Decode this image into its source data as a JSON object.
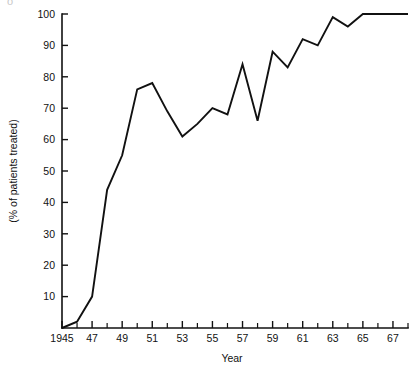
{
  "figure": {
    "corner_artifact": "o"
  },
  "chart_data": {
    "type": "line",
    "title": "",
    "subtitle": "",
    "xlabel": "Year",
    "ylabel": "(% of patients treated)",
    "xlim": [
      1945,
      1968
    ],
    "ylim": [
      0,
      100
    ],
    "grid": false,
    "legend": null,
    "legend_position": "none",
    "line_color": "#111111",
    "x_tick_step_minor": 1,
    "x_tick_step_major": 2,
    "y_tick_step": 10,
    "x_tick_labels": [
      "1945",
      "47",
      "49",
      "51",
      "53",
      "55",
      "57",
      "59",
      "61",
      "63",
      "65",
      "67"
    ],
    "x_tick_label_years": [
      1945,
      1947,
      1949,
      1951,
      1953,
      1955,
      1957,
      1959,
      1961,
      1963,
      1965,
      1967
    ],
    "y_tick_labels": [
      "10",
      "20",
      "30",
      "40",
      "50",
      "60",
      "70",
      "80",
      "90",
      "100"
    ],
    "y_tick_values": [
      10,
      20,
      30,
      40,
      50,
      60,
      70,
      80,
      90,
      100
    ],
    "x": [
      1945,
      1946,
      1947,
      1948,
      1949,
      1950,
      1951,
      1952,
      1953,
      1954,
      1955,
      1956,
      1957,
      1958,
      1959,
      1960,
      1961,
      1962,
      1963,
      1964,
      1965,
      1966,
      1967,
      1968
    ],
    "values": [
      0,
      2,
      10,
      44,
      55,
      76,
      78,
      69,
      61,
      65,
      70,
      68,
      84,
      66,
      88,
      83,
      92,
      90,
      99,
      96,
      100,
      100,
      100,
      100
    ],
    "series": [
      {
        "name": "% of patients treated",
        "values": [
          0,
          2,
          10,
          44,
          55,
          76,
          78,
          69,
          61,
          65,
          70,
          68,
          84,
          66,
          88,
          83,
          92,
          90,
          99,
          96,
          100,
          100,
          100,
          100
        ]
      }
    ]
  }
}
